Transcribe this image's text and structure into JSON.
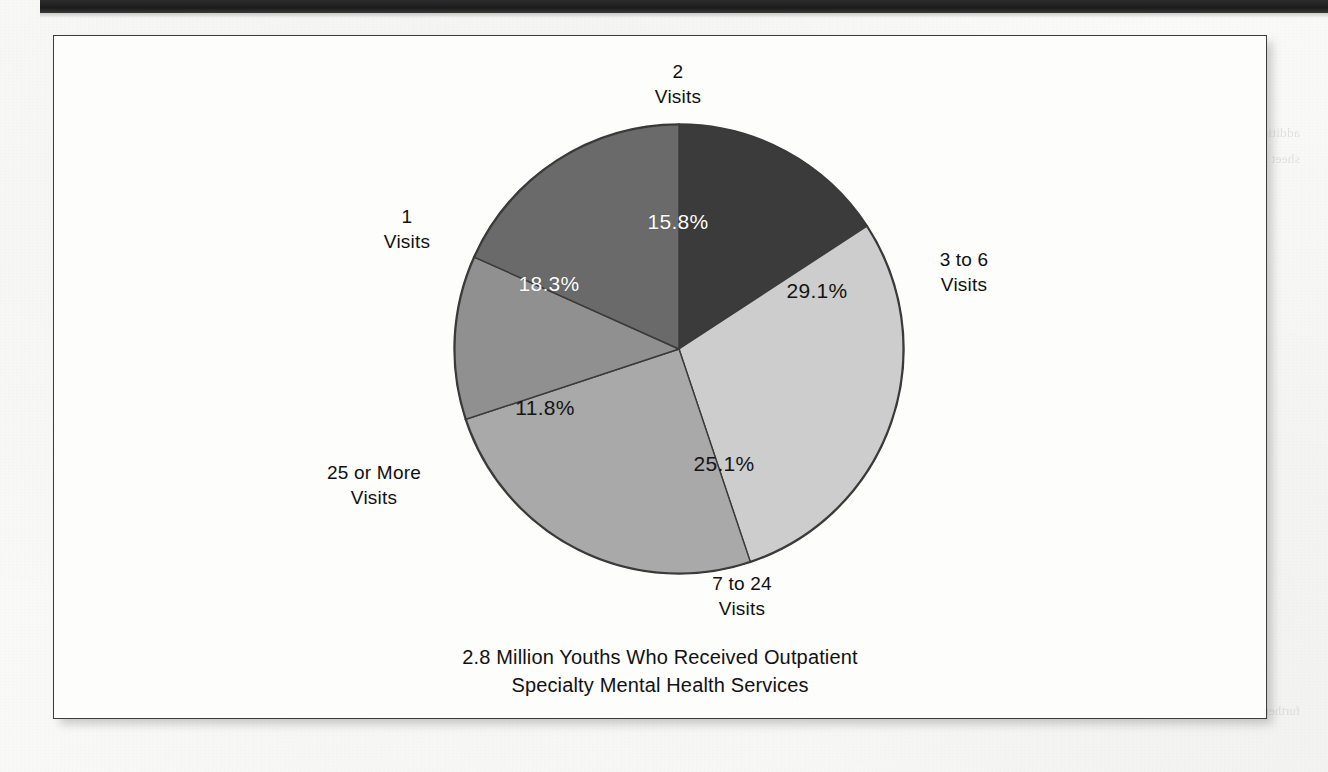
{
  "page": {
    "background_color": "#f8f8f7",
    "top_strip_color": "#1f1f1f",
    "frame_border_color": "#3c3c3c"
  },
  "figure": {
    "caption": "2.8 Million Youths Who Received Outpatient\nSpecialty Mental Health Services"
  },
  "chart_data": {
    "type": "pie",
    "title": "2.8 Million Youths Who Received Outpatient Specialty Mental Health Services",
    "unit": "percent",
    "total_label": "2.8 Million Youths",
    "start_angle_deg": 0,
    "direction": "clockwise",
    "legend": "none",
    "labels_position": "outside-callout",
    "categories": [
      "2\nVisits",
      "3 to 6\nVisits",
      "7 to 24\nVisits",
      "25 or More\nVisits",
      "1\nVisits"
    ],
    "values": [
      15.8,
      29.1,
      25.1,
      11.8,
      18.3
    ],
    "value_labels": [
      "15.8%",
      "29.1%",
      "25.1%",
      "11.8%",
      "18.3%"
    ],
    "colors": [
      "#3b3b3b",
      "#cdcdcd",
      "#a9a9a9",
      "#909090",
      "#6a6a6a"
    ],
    "label_text_colors": [
      "#ffffff",
      "#141414",
      "#141414",
      "#141414",
      "#ffffff"
    ],
    "slices": [
      {
        "name": "2 Visits",
        "category": "2\nVisits",
        "value": 15.8,
        "value_label": "15.8%",
        "color": "#3b3b3b",
        "label_text_color": "#ffffff",
        "pct_x": 677,
        "pct_y": 221,
        "cat_x": 677,
        "cat_y": 83
      },
      {
        "name": "3 to 6 Visits",
        "category": "3 to 6\nVisits",
        "value": 29.1,
        "value_label": "29.1%",
        "color": "#cdcdcd",
        "label_text_color": "#141414",
        "pct_x": 816,
        "pct_y": 290,
        "cat_x": 963,
        "cat_y": 271
      },
      {
        "name": "7 to 24 Visits",
        "category": "7 to 24\nVisits",
        "value": 25.1,
        "value_label": "25.1%",
        "color": "#a9a9a9",
        "label_text_color": "#141414",
        "pct_x": 723,
        "pct_y": 463,
        "cat_x": 741,
        "cat_y": 595
      },
      {
        "name": "25 or More Visits",
        "category": "25 or More\nVisits",
        "value": 11.8,
        "value_label": "11.8%",
        "color": "#909090",
        "label_text_color": "#141414",
        "pct_x": 544,
        "pct_y": 407,
        "cat_x": 373,
        "cat_y": 484
      },
      {
        "name": "1 Visits",
        "category": "1\nVisits",
        "value": 18.3,
        "value_label": "18.3%",
        "color": "#6a6a6a",
        "label_text_color": "#ffffff",
        "pct_x": 548,
        "pct_y": 283,
        "cat_x": 406,
        "cat_y": 228
      }
    ]
  },
  "ghost_text": {
    "left": "of the ghost text bleeding through the scanned page stock is faint and illegible at this resolution and sits behind the figure frame",
    "right": "additional faint reversed text from the opposite side of the printed sheet shows through the paper in the right hand margin of the scan",
    "bottom_left": "faint show-through along the lower edge of the scanned sheet",
    "bottom_right": "further faint show-through near the lower right corner margin"
  }
}
